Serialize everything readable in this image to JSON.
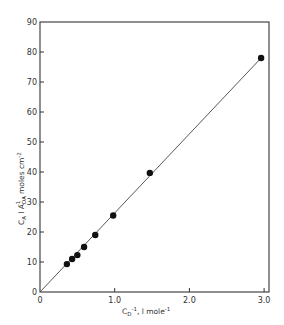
{
  "chart_data": {
    "type": "scatter",
    "title": "",
    "xlabel": "C_D^-1, l mole^-1",
    "ylabel": "C_A l A_DA^-1, moles cm^-2",
    "xlim": [
      0,
      3.07
    ],
    "ylim": [
      0,
      90
    ],
    "xticks": [
      0,
      1.0,
      2.0,
      3.0
    ],
    "xtick_labels": [
      "0",
      "1.0",
      "2.0",
      "3.0"
    ],
    "yticks": [
      0,
      10,
      20,
      30,
      40,
      50,
      60,
      70,
      80,
      90
    ],
    "ytick_labels": [
      "0",
      "10",
      "20",
      "30",
      "40",
      "50",
      "60",
      "70",
      "80",
      "90"
    ],
    "grid": false,
    "legend": null,
    "series": [
      {
        "name": "data",
        "marker": "filled-circle",
        "x": [
          0.36,
          0.43,
          0.5,
          0.59,
          0.74,
          0.98,
          1.47,
          2.96
        ],
        "y": [
          9.3,
          11,
          12.3,
          15,
          19,
          25.5,
          39.7,
          78
        ]
      },
      {
        "name": "fit line",
        "type": "line",
        "x": [
          0,
          2.96
        ],
        "y": [
          0,
          78
        ]
      }
    ]
  },
  "labels": {
    "x_main": "C",
    "x_sub": "D",
    "x_sup": "-1",
    "x_rest": ", l mole",
    "x_rest_sup": "-1",
    "y_C": "C",
    "y_C_sub": "A",
    "y_l": " l  A",
    "y_A_sub": "DA",
    "y_A_sup": "-1",
    "y_rest": ", moles cm",
    "y_rest_sup": "-2"
  }
}
